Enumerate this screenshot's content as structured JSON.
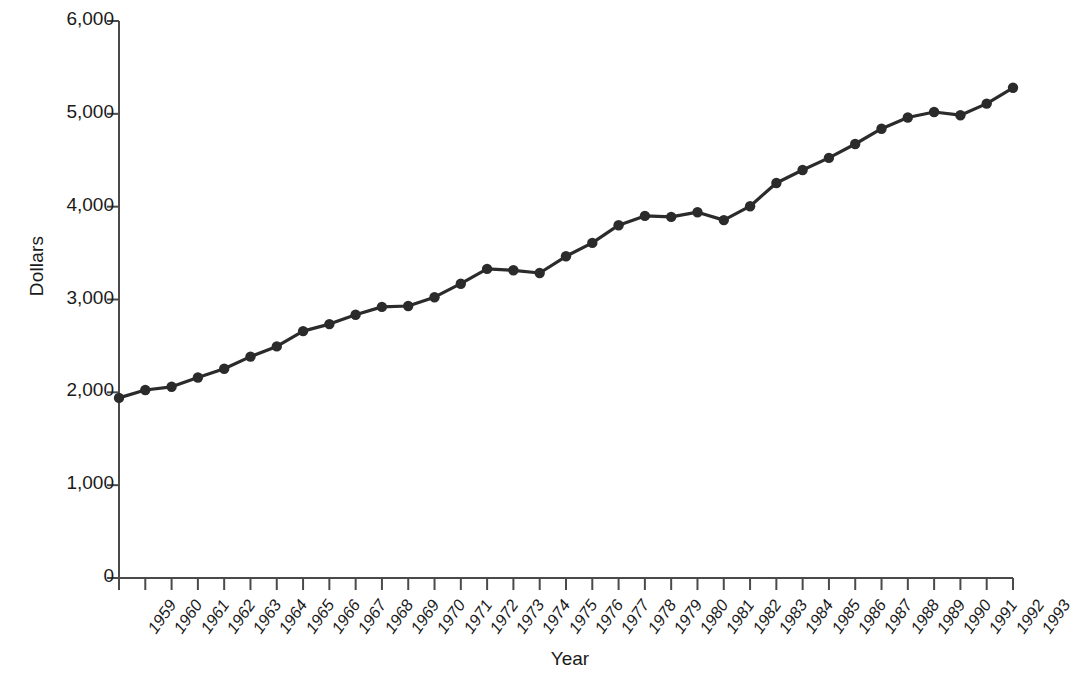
{
  "chart_data": {
    "type": "line",
    "title": "",
    "xlabel": "Year",
    "ylabel": "Dollars",
    "xlim": [
      1959,
      1993
    ],
    "ylim": [
      0,
      6000
    ],
    "grid": false,
    "legend": null,
    "marker": "filled-circle",
    "line_color": "#2b2b2b",
    "categories": [
      "1959",
      "1960",
      "1961",
      "1962",
      "1963",
      "1964",
      "1965",
      "1966",
      "1967",
      "1968",
      "1969",
      "1970",
      "1971",
      "1972",
      "1973",
      "1974",
      "1975",
      "1976",
      "1977",
      "1978",
      "1979",
      "1980",
      "1981",
      "1982",
      "1983",
      "1984",
      "1985",
      "1986",
      "1987",
      "1988",
      "1989",
      "1990",
      "1991",
      "1992",
      "1993"
    ],
    "values": [
      1940,
      2025,
      2060,
      2160,
      2255,
      2385,
      2495,
      2660,
      2735,
      2835,
      2920,
      2930,
      3025,
      3170,
      3330,
      3315,
      3285,
      3465,
      3610,
      3800,
      3900,
      3890,
      3940,
      3855,
      4005,
      4255,
      4395,
      4525,
      4675,
      4840,
      4960,
      5020,
      4985,
      5110,
      5280
    ],
    "ytick_labels": [
      "0",
      "1,000",
      "2,000",
      "3,000",
      "4,000",
      "5,000",
      "6,000"
    ],
    "ytick_values": [
      0,
      1000,
      2000,
      3000,
      4000,
      5000,
      6000
    ]
  }
}
